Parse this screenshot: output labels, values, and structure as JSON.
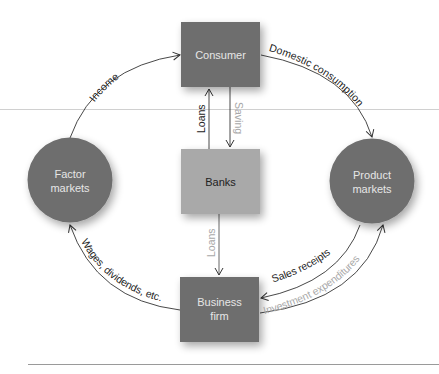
{
  "diagram": {
    "nodes": {
      "consumer": {
        "label": "Consumer",
        "shape": "rect",
        "fill": "#6e6e6e",
        "text_color": "#e6e6e6"
      },
      "banks": {
        "label": "Banks",
        "shape": "rect",
        "fill": "#a9a9a9",
        "text_color": "#222222"
      },
      "business": {
        "label_line1": "Business",
        "label_line2": "firm",
        "shape": "rect",
        "fill": "#6e6e6e",
        "text_color": "#e6e6e6"
      },
      "factor": {
        "label_line1": "Factor",
        "label_line2": "markets",
        "shape": "circle",
        "fill": "#6e6e6e",
        "text_color": "#e6e6e6"
      },
      "product": {
        "label_line1": "Product",
        "label_line2": "markets",
        "shape": "circle",
        "fill": "#6e6e6e",
        "text_color": "#e6e6e6"
      }
    },
    "flows": {
      "income": {
        "label": "Income",
        "from": "Factor markets",
        "to": "Consumer",
        "color": "#222222"
      },
      "domestic_consumption": {
        "label": "Domestic consumption",
        "from": "Consumer",
        "to": "Product markets",
        "color": "#222222"
      },
      "loans_up": {
        "label": "Loans",
        "from": "Banks",
        "to": "Consumer",
        "color": "#222222"
      },
      "saving": {
        "label": "Saving",
        "from": "Consumer",
        "to": "Banks",
        "color": "#a0a0a0"
      },
      "loans_down": {
        "label": "Loans",
        "from": "Banks",
        "to": "Business firm",
        "color": "#a0a0a0"
      },
      "sales_receipts": {
        "label": "Sales receipts",
        "from": "Product markets",
        "to": "Business firm",
        "color": "#222222"
      },
      "investment_expenditures": {
        "label": "Investment expenditures",
        "from": "Business firm",
        "to": "Product markets",
        "color": "#a0a0a0"
      },
      "wages": {
        "label": "Wages, dividends, etc.",
        "from": "Business firm",
        "to": "Factor markets",
        "color": "#222222"
      }
    },
    "colors": {
      "line": "#333333",
      "muted": "#a0a0a0",
      "rule": "#bdbdbd"
    }
  }
}
